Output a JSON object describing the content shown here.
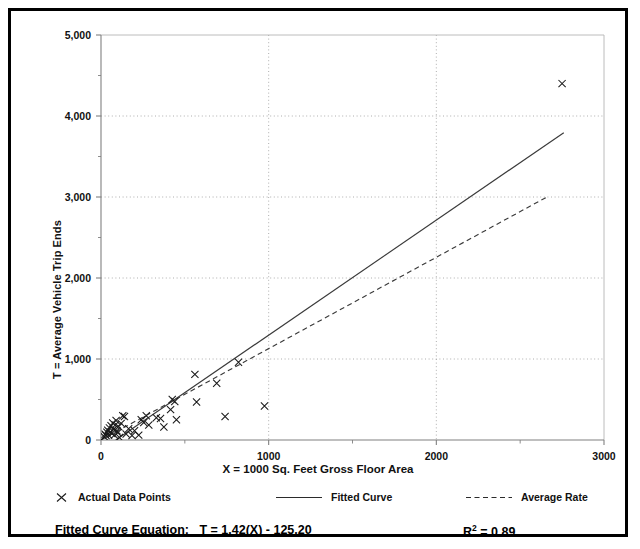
{
  "chart_data": {
    "type": "scatter",
    "title": "",
    "xlabel": "X = 1000 Sq. Feet Gross Floor Area",
    "ylabel": "T = Average Vehicle Trip Ends",
    "xlim": [
      0,
      3000
    ],
    "ylim": [
      0,
      5000
    ],
    "xticks": [
      0,
      1000,
      2000,
      3000
    ],
    "xticklabels": [
      "0",
      "1000",
      "2000",
      "3000"
    ],
    "xminorticks": [
      500,
      1500,
      2500
    ],
    "yticks": [
      0,
      1000,
      2000,
      3000,
      4000,
      5000
    ],
    "yticklabels": [
      "0",
      "1,000",
      "2,000",
      "3,000",
      "4,000",
      "5,000"
    ],
    "yminorticks": [
      500,
      1500,
      2500,
      3500,
      4500
    ],
    "grid": "dotted-major",
    "legend_position": "below-plot",
    "series": [
      {
        "name": "Actual Data Points",
        "type": "scatter",
        "marker": "x",
        "points": [
          [
            20,
            40
          ],
          [
            25,
            70
          ],
          [
            30,
            55
          ],
          [
            35,
            95
          ],
          [
            40,
            120
          ],
          [
            45,
            60
          ],
          [
            50,
            150
          ],
          [
            55,
            100
          ],
          [
            60,
            175
          ],
          [
            65,
            80
          ],
          [
            70,
            210
          ],
          [
            75,
            130
          ],
          [
            80,
            60
          ],
          [
            85,
            185
          ],
          [
            90,
            240
          ],
          [
            95,
            115
          ],
          [
            100,
            90
          ],
          [
            105,
            165
          ],
          [
            110,
            30
          ],
          [
            120,
            205
          ],
          [
            130,
            300
          ],
          [
            140,
            290
          ],
          [
            150,
            75
          ],
          [
            165,
            140
          ],
          [
            185,
            55
          ],
          [
            200,
            115
          ],
          [
            225,
            60
          ],
          [
            240,
            250
          ],
          [
            255,
            215
          ],
          [
            270,
            300
          ],
          [
            285,
            185
          ],
          [
            330,
            275
          ],
          [
            355,
            265
          ],
          [
            375,
            160
          ],
          [
            415,
            375
          ],
          [
            425,
            500
          ],
          [
            440,
            475
          ],
          [
            450,
            250
          ],
          [
            560,
            810
          ],
          [
            570,
            470
          ],
          [
            690,
            700
          ],
          [
            740,
            290
          ],
          [
            820,
            960
          ],
          [
            975,
            420
          ],
          [
            2750,
            4400
          ]
        ]
      },
      {
        "name": "Fitted Curve",
        "type": "line",
        "style": "solid",
        "equation": "T = 1.42(X) - 125.20",
        "slope": 1.42,
        "intercept": -125.2,
        "x_range": [
          88,
          2760
        ]
      },
      {
        "name": "Average Rate",
        "type": "line",
        "style": "dashed",
        "slope": 1.128,
        "intercept": 0,
        "x_range": [
          0,
          2660
        ]
      }
    ],
    "annotations": {
      "equation_label": "Fitted Curve Equation:",
      "equation_value": "T = 1.42(X) - 125.20",
      "r_squared_symbol": "R",
      "r_squared_exponent": "2",
      "r_squared_value": "= 0.89"
    }
  },
  "legend": {
    "items": [
      {
        "label": "Actual Data Points",
        "marker": "x-marker-icon"
      },
      {
        "label": "Fitted Curve",
        "marker": "solid-line-icon"
      },
      {
        "label": "Average Rate",
        "marker": "dashed-line-icon"
      }
    ]
  },
  "colors": {
    "border": "#000000",
    "axis": "#808080",
    "grid": "#9a9a9a",
    "marker": "#1a1a1a",
    "fitted_line": "#3a3a3a",
    "average_line": "#3a3a3a",
    "text": "#111111"
  }
}
